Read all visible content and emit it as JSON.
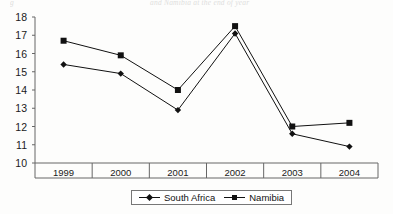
{
  "page": {
    "bleed_text_left": "g",
    "bleed_text_right": "and Namibia at the end of year"
  },
  "legend": {
    "position": "bottom-center",
    "entries": [
      {
        "label": "South Africa",
        "marker": "diamond-marker-icon"
      },
      {
        "label": "Namibia",
        "marker": "square-marker-icon"
      }
    ]
  },
  "chart_data": {
    "type": "line",
    "title": "",
    "xlabel": "",
    "ylabel": "",
    "categories": [
      "1999",
      "2000",
      "2001",
      "2002",
      "2003",
      "2004"
    ],
    "series": [
      {
        "name": "South Africa",
        "marker": "diamond",
        "values": [
          15.4,
          14.9,
          12.9,
          17.1,
          11.6,
          10.9
        ]
      },
      {
        "name": "Namibia",
        "marker": "square",
        "values": [
          16.7,
          15.9,
          14.0,
          17.5,
          12.0,
          12.2
        ]
      }
    ],
    "ylim": [
      10,
      18
    ],
    "yticks": [
      10,
      11,
      12,
      13,
      14,
      15,
      16,
      17,
      18
    ],
    "grid": false,
    "line_color": "#111111",
    "frame_color": "#666666"
  }
}
